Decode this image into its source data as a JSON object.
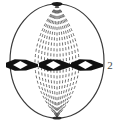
{
  "figure": {
    "name": "cell-metaphase-spindle-diagram",
    "caption": "",
    "canvas": {
      "width": 118,
      "height": 123,
      "background": "#ffffff"
    },
    "cell": {
      "name": "cell-membrane",
      "shape": "ellipse",
      "center_x": 57,
      "center_y": 61,
      "radius_x": 47,
      "radius_y": 57,
      "stroke_color": "#3a3a3a",
      "stroke_width": 1.2,
      "fill": "none"
    },
    "poles": [
      {
        "name": "spindle-pole-top",
        "x": 57,
        "y": 4,
        "width": 11,
        "height": 4,
        "color": "#1a1a1a"
      },
      {
        "name": "spindle-pole-bottom",
        "x": 57,
        "y": 118,
        "width": 9,
        "height": 3,
        "color": "#2a2a2a"
      }
    ],
    "spindle_fibers": {
      "name": "spindle-fibers",
      "count": 15,
      "style": "dashed",
      "dash_pattern": "3 2.4",
      "stroke_color": "#555555",
      "stroke_width": 0.85,
      "top_pole_x": 57,
      "top_pole_y": 5,
      "bottom_pole_x": 57,
      "bottom_pole_y": 117,
      "equator_y": 65,
      "spread_half_width": 44
    },
    "chromosomes": {
      "name": "chromosomes-metaphase-plate",
      "count": 3,
      "equator_y": 65,
      "fill_color": "#111111",
      "center_fill": "#ffffff",
      "items": [
        {
          "name": "chromosome-left",
          "center_x": 22,
          "center_y": 65,
          "half_width": 16,
          "half_height": 5
        },
        {
          "name": "chromosome-middle",
          "center_x": 55,
          "center_y": 65,
          "half_width": 16,
          "half_height": 5
        },
        {
          "name": "chromosome-right",
          "center_x": 87,
          "center_y": 65,
          "half_width": 16,
          "half_height": 5
        }
      ]
    },
    "labels": [
      {
        "name": "figure-label-2",
        "text": "2",
        "x": 110,
        "y": 69,
        "anchor": "middle"
      }
    ]
  },
  "chart_data": {
    "type": "diagram",
    "title": "",
    "elements": [
      {
        "element": "cell-membrane",
        "description": "oval cell outline",
        "value": 1
      },
      {
        "element": "spindle-pole",
        "description": "dark pole at top and bottom",
        "value": 2
      },
      {
        "element": "spindle-fiber",
        "description": "dashed lines from pole to pole",
        "value": 15
      },
      {
        "element": "chromosome",
        "description": "dark bowtie shapes with hollow centre on equator",
        "value": 3
      }
    ],
    "annotations": [
      "2"
    ]
  }
}
